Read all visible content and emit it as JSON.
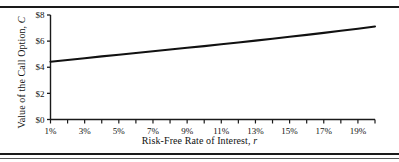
{
  "figure": {
    "background_color": "#ffffff",
    "line_color": "#111111",
    "axis_color": "#1a1a1a",
    "rule_top": true,
    "rule_bottom": true
  },
  "chart_data": {
    "type": "line",
    "title": "",
    "xlabel_text": "Risk-Free Rate of Interest, ",
    "xlabel_symbol": "r",
    "ylabel_text": "Value of the Call Option, ",
    "ylabel_symbol": "C",
    "xlabel": "Risk-Free Rate of Interest, r",
    "ylabel": "Value of the Call Option, C",
    "x_tick_labels": [
      "1%",
      "3%",
      "5%",
      "7%",
      "9%",
      "11%",
      "13%",
      "15%",
      "17%",
      "19%"
    ],
    "y_tick_labels": [
      "$0",
      "$2",
      "$4",
      "$6",
      "$8"
    ],
    "xlim": [
      1,
      20
    ],
    "ylim": [
      0,
      8
    ],
    "minor_tick_interval": 1,
    "grid": false,
    "legend": "none",
    "x": [
      1,
      2,
      3,
      4,
      5,
      6,
      7,
      8,
      9,
      10,
      11,
      12,
      13,
      14,
      15,
      16,
      17,
      18,
      19,
      20
    ],
    "series": [
      {
        "name": "Call Option Value",
        "values": [
          4.42,
          4.55,
          4.69,
          4.83,
          4.96,
          5.09,
          5.22,
          5.36,
          5.49,
          5.62,
          5.76,
          5.9,
          6.04,
          6.18,
          6.33,
          6.48,
          6.63,
          6.79,
          6.95,
          7.12
        ]
      }
    ]
  }
}
